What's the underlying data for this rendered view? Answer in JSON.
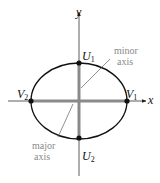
{
  "diagram": {
    "axes": {
      "x_label": "x",
      "y_label": "y"
    },
    "vertices": [
      {
        "name": "V",
        "sub": "1",
        "position": "right end of major axis"
      },
      {
        "name": "V",
        "sub": "2",
        "position": "left end of major axis"
      },
      {
        "name": "U",
        "sub": "1",
        "position": "top end of minor axis"
      },
      {
        "name": "U",
        "sub": "2",
        "position": "bottom end of minor axis"
      }
    ],
    "annotations": {
      "minor_line1": "minor",
      "minor_line2": "axis",
      "major_line1": "major",
      "major_line2": "axis"
    },
    "colors": {
      "curve": "#111111",
      "axis_highlight": "#8a8a8a",
      "coordinate_axes": "#333333",
      "annotation_text": "#8a8a8a"
    }
  }
}
